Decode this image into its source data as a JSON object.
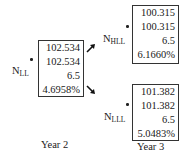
{
  "nodes": {
    "LL": {
      "label_main": "N",
      "label_sub": "LL",
      "values": [
        "102.534",
        "102.534",
        "6.5",
        "4.6958%"
      ]
    },
    "HLL": {
      "label_main": "N",
      "label_sub": "HLL",
      "values": [
        "100.315",
        "100.315",
        "6.5",
        "6.1660%"
      ]
    },
    "LLL": {
      "label_main": "N",
      "label_sub": "LLL",
      "values": [
        "101.382",
        "101.382",
        "6.5",
        "5.0483%"
      ]
    }
  },
  "years": {
    "year2": "Year 2",
    "year3": "Year 3"
  },
  "arrows": [
    {
      "from": "LL",
      "to": "HLL",
      "direction": "up-right"
    },
    {
      "from": "LL",
      "to": "LLL",
      "direction": "down-right"
    }
  ]
}
